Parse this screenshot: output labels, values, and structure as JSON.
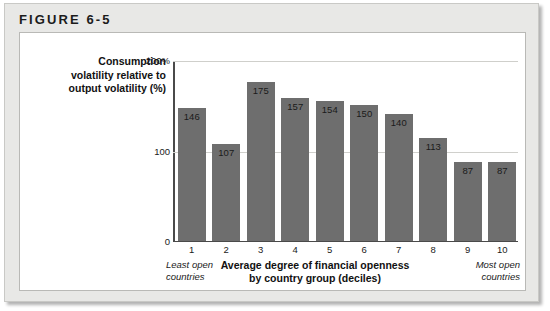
{
  "figure": {
    "header": "FIGURE 6-5"
  },
  "chart_data": {
    "type": "bar",
    "title": "",
    "categories": [
      "1",
      "2",
      "3",
      "4",
      "5",
      "6",
      "7",
      "8",
      "9",
      "10"
    ],
    "values": [
      146,
      107,
      175,
      157,
      154,
      150,
      140,
      113,
      87,
      87
    ],
    "xlabel": "Average degree of financial openness by country group (deciles)",
    "ylabel": "Consumption volatility relative to output volatility (%)",
    "ylim": [
      0,
      200
    ],
    "yticks": [
      "200%",
      "100",
      "0"
    ],
    "ytick_values": [
      200,
      100,
      0
    ],
    "grid": true,
    "legend": "none",
    "bar_color": "#6e6e6e",
    "annotations": {
      "left": "Least open countries",
      "right": "Most open countries"
    }
  },
  "axes": {
    "y_title_lines": [
      "Consumption",
      "volatility relative to",
      "output volatility (%)"
    ],
    "x_title_lines": [
      "Average degree of financial openness",
      "by country group (deciles)"
    ],
    "note_left_lines": [
      "Least open",
      "countries"
    ],
    "note_right_lines": [
      "Most open",
      "countries"
    ]
  },
  "colors": {
    "bar": "#6e6e6e",
    "frame_background": "#e8e8e6",
    "panel_background": "#ffffff",
    "axis": "#4a4a4a",
    "gridline": "#d0d0cc",
    "text": "#1a1a1a"
  }
}
